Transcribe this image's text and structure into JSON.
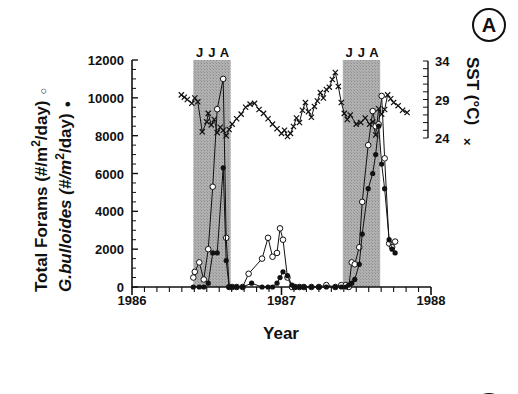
{
  "chart_data": {
    "type": "line",
    "panel_label": "A",
    "title": "",
    "xlabel": "Year",
    "ylabel_left": [
      "Total Forams (#/m2/day)",
      "G.bulloides (#/m2/day)"
    ],
    "ylabel_right": "SST (°C)",
    "xlim": [
      1986,
      1988
    ],
    "ylim_left": [
      0,
      12000
    ],
    "ylim_right": [
      24,
      34
    ],
    "x_ticks": [
      "1986",
      "1987",
      "1988"
    ],
    "y_ticks_left": [
      "0",
      "2000",
      "4000",
      "6000",
      "8000",
      "10000",
      "12000"
    ],
    "y_ticks_right": [
      "24",
      "29",
      "34"
    ],
    "grid": false,
    "shaded_periods": [
      {
        "label": "J J A",
        "months": [
          "J",
          "J",
          "A"
        ],
        "start": 1986.41,
        "end": 1986.66
      },
      {
        "label": "J J A",
        "months": [
          "J",
          "J",
          "A"
        ],
        "start": 1987.41,
        "end": 1987.66
      }
    ],
    "series": [
      {
        "name": "Total Forams",
        "marker": "open-circle",
        "axis": "left",
        "x": [
          1986.41,
          1986.42,
          1986.45,
          1986.48,
          1986.51,
          1986.54,
          1986.57,
          1986.61,
          1986.63,
          1986.65,
          1986.67,
          1986.7,
          1986.74,
          1986.78,
          1986.87,
          1986.91,
          1986.94,
          1986.97,
          1986.99,
          1987.01,
          1987.04,
          1987.07,
          1987.09,
          1987.12,
          1987.15,
          1987.2,
          1987.25,
          1987.3,
          1987.36,
          1987.4,
          1987.43,
          1987.45,
          1987.47,
          1987.49,
          1987.52,
          1987.54,
          1987.58,
          1987.61,
          1987.63,
          1987.65,
          1987.67,
          1987.69,
          1987.72,
          1987.74,
          1987.76
        ],
        "values": [
          500,
          800,
          1300,
          400,
          2000,
          5300,
          9400,
          11000,
          2600,
          0,
          0,
          0,
          0,
          700,
          1500,
          2600,
          1600,
          1800,
          3100,
          2500,
          500,
          0,
          0,
          0,
          0,
          0,
          0,
          100,
          0,
          100,
          100,
          0,
          1300,
          1200,
          2100,
          4500,
          7500,
          9300,
          8500,
          8600,
          10100,
          6800,
          2300,
          2100,
          2400
        ]
      },
      {
        "name": "G.bulloides",
        "marker": "filled-circle",
        "axis": "left",
        "x": [
          1986.41,
          1986.45,
          1986.48,
          1986.51,
          1986.54,
          1986.57,
          1986.61,
          1986.63,
          1986.65,
          1986.67,
          1986.7,
          1986.74,
          1986.8,
          1986.87,
          1986.91,
          1986.94,
          1986.97,
          1986.99,
          1987.01,
          1987.04,
          1987.07,
          1987.09,
          1987.12,
          1987.15,
          1987.2,
          1987.25,
          1987.3,
          1987.36,
          1987.4,
          1987.43,
          1987.45,
          1987.47,
          1987.49,
          1987.52,
          1987.54,
          1987.58,
          1987.61,
          1987.63,
          1987.65,
          1987.67,
          1987.69,
          1987.72,
          1987.74,
          1987.76
        ],
        "values": [
          0,
          0,
          0,
          200,
          1800,
          1800,
          6300,
          1400,
          0,
          0,
          0,
          0,
          200,
          0,
          0,
          0,
          200,
          500,
          800,
          600,
          100,
          0,
          0,
          0,
          0,
          0,
          0,
          0,
          0,
          0,
          100,
          200,
          400,
          1200,
          2800,
          5200,
          6000,
          7000,
          8500,
          6500,
          5200,
          2500,
          2000,
          1800
        ]
      },
      {
        "name": "SST",
        "marker": "x",
        "axis": "right",
        "x": [
          1986.33,
          1986.35,
          1986.37,
          1986.4,
          1986.42,
          1986.44,
          1986.47,
          1986.5,
          1986.51,
          1986.53,
          1986.55,
          1986.57,
          1986.59,
          1986.61,
          1986.63,
          1986.65,
          1986.67,
          1986.7,
          1986.73,
          1986.76,
          1986.79,
          1986.82,
          1986.85,
          1986.88,
          1986.91,
          1986.94,
          1986.97,
          1987.0,
          1987.02,
          1987.04,
          1987.06,
          1987.08,
          1987.1,
          1987.12,
          1987.14,
          1987.16,
          1987.18,
          1987.2,
          1987.22,
          1987.24,
          1987.26,
          1987.28,
          1987.3,
          1987.32,
          1987.34,
          1987.36,
          1987.38,
          1987.4,
          1987.42,
          1987.44,
          1987.46,
          1987.5,
          1987.53,
          1987.56,
          1987.59,
          1987.61,
          1987.63,
          1987.65,
          1987.67,
          1987.69,
          1987.71,
          1987.73,
          1987.75,
          1987.78,
          1987.81,
          1987.84
        ],
        "values": [
          29.6,
          29.3,
          29.0,
          28.5,
          29.2,
          28.7,
          24.8,
          26.1,
          27.2,
          25.7,
          26.4,
          24.7,
          25.4,
          25.0,
          24.3,
          25.1,
          25.8,
          26.5,
          27.1,
          28.0,
          28.4,
          28.5,
          27.7,
          27.2,
          26.5,
          25.8,
          25.2,
          24.6,
          25.0,
          24.2,
          24.6,
          25.5,
          26.6,
          26.0,
          27.6,
          28.6,
          27.4,
          26.7,
          28.1,
          28.8,
          29.9,
          29.2,
          30.3,
          30.6,
          31.6,
          32.5,
          30.7,
          28.6,
          27.2,
          26.4,
          27.0,
          25.8,
          26.0,
          26.6,
          25.8,
          26.1,
          24.4,
          27.8,
          27.1,
          27.7,
          29.6,
          29.1,
          28.6,
          28.2,
          27.6,
          27.3
        ]
      }
    ],
    "legend": {
      "position": "axis-labels",
      "entries": [
        "○ Total Forams",
        "● G.bulloides",
        "× SST"
      ]
    }
  },
  "labels": {
    "panel_label": "A",
    "partial_panel_label": "B",
    "y_left_line1": "Total Forams (#/m",
    "y_left_line1_sup": "2",
    "y_left_line1_tail": "/day)",
    "y_left_line1_marker": "○",
    "y_left_line2": "G.bulloides (#/m",
    "y_left_line2_sup": "2",
    "y_left_line2_tail": "/day)",
    "y_left_line2_marker": "●",
    "y_right": "SST (°C)",
    "y_right_marker": "×",
    "x_title": "Year"
  },
  "colors": {
    "shade": "#a8a8a8",
    "ink": "#111111",
    "background": "#ffffff"
  }
}
